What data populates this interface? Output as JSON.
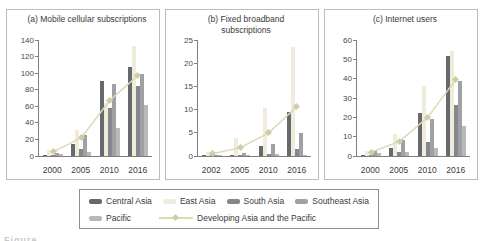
{
  "colors": {
    "central_asia": "#666a6e",
    "east_asia": "#efecdb",
    "south_asia": "#84878b",
    "southeast_asia": "#9fa2a5",
    "pacific": "#b7b9bb",
    "line": "#ddd8b5",
    "marker": "#d1cca4"
  },
  "legend": {
    "items": [
      {
        "key": "central_asia",
        "label": "Central Asia"
      },
      {
        "key": "east_asia",
        "label": "East Asia"
      },
      {
        "key": "south_asia",
        "label": "South Asia"
      },
      {
        "key": "southeast_asia",
        "label": "Southeast Asia"
      },
      {
        "key": "pacific",
        "label": "Pacific"
      }
    ],
    "line_label": "Developing Asia and the Pacific"
  },
  "bottom_caption_fragment": "Figure",
  "chart_data": [
    {
      "type": "bar",
      "title": "(a) Mobile cellular subscriptions",
      "categories": [
        "2000",
        "2005",
        "2010",
        "2016"
      ],
      "ylim": [
        0,
        140
      ],
      "yticks": [
        0,
        20,
        40,
        60,
        80,
        100,
        120,
        140
      ],
      "series": [
        {
          "name": "Central Asia",
          "key": "central_asia",
          "values": [
            1.5,
            15,
            90,
            108
          ]
        },
        {
          "name": "East Asia",
          "key": "east_asia",
          "values": [
            7,
            32,
            64,
            133
          ]
        },
        {
          "name": "South Asia",
          "key": "south_asia",
          "values": [
            0.5,
            8,
            58,
            84
          ]
        },
        {
          "name": "Southeast Asia",
          "key": "southeast_asia",
          "values": [
            4,
            25,
            87,
            99
          ]
        },
        {
          "name": "Pacific",
          "key": "pacific",
          "values": [
            2.5,
            5,
            34,
            62
          ]
        }
      ],
      "line_series": {
        "name": "Developing Asia and the Pacific",
        "values": [
          5,
          22,
          67,
          97
        ]
      }
    },
    {
      "type": "bar",
      "title": "(b) Fixed broadband subscriptions",
      "categories": [
        "2002",
        "2005",
        "2010",
        "2016"
      ],
      "ylim": [
        0,
        25
      ],
      "yticks": [
        0,
        5,
        10,
        15,
        20,
        25
      ],
      "series": [
        {
          "name": "Central Asia",
          "key": "central_asia",
          "values": [
            0.05,
            0.15,
            2.2,
            9.4
          ]
        },
        {
          "name": "East Asia",
          "key": "east_asia",
          "values": [
            0.9,
            3.8,
            10.3,
            23.4
          ]
        },
        {
          "name": "South Asia",
          "key": "south_asia",
          "values": [
            0.02,
            0.15,
            0.5,
            1.5
          ]
        },
        {
          "name": "Southeast Asia",
          "key": "southeast_asia",
          "values": [
            0.15,
            0.6,
            2.6,
            4.9
          ]
        },
        {
          "name": "Pacific",
          "key": "pacific",
          "values": [
            0.1,
            0.15,
            0.4,
            0.3
          ]
        }
      ],
      "line_series": {
        "name": "Developing Asia and the Pacific",
        "values": [
          0.5,
          1.8,
          5,
          10.6
        ]
      }
    },
    {
      "type": "bar",
      "title": "(c) Internet users",
      "categories": [
        "2000",
        "2005",
        "2010",
        "2016"
      ],
      "ylim": [
        0,
        60
      ],
      "yticks": [
        0,
        10,
        20,
        30,
        40,
        50,
        60
      ],
      "series": [
        {
          "name": "Central Asia",
          "key": "central_asia",
          "values": [
            0.5,
            4,
            22.3,
            51.5
          ]
        },
        {
          "name": "East Asia",
          "key": "east_asia",
          "values": [
            2.7,
            11.5,
            36.3,
            54.5
          ]
        },
        {
          "name": "South Asia",
          "key": "south_asia",
          "values": [
            0.4,
            2.3,
            7,
            26.5
          ]
        },
        {
          "name": "Southeast Asia",
          "key": "southeast_asia",
          "values": [
            2.4,
            8.2,
            19,
            38.7
          ]
        },
        {
          "name": "Pacific",
          "key": "pacific",
          "values": [
            1.8,
            2.1,
            4,
            15.5
          ]
        }
      ],
      "line_series": {
        "name": "Developing Asia and the Pacific",
        "values": [
          2,
          7.5,
          20,
          39.5
        ]
      }
    }
  ]
}
